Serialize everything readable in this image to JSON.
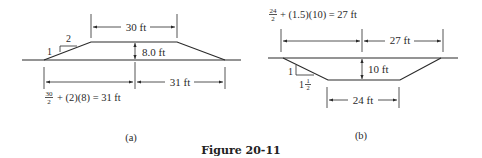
{
  "figure": {
    "caption": "Figure 20-11",
    "panels": [
      {
        "id": "a",
        "label": "(a)",
        "type": "embankment",
        "top_width_label": "30 ft",
        "height_label": "8.0 ft",
        "half_base_label": "31 ft",
        "slope": {
          "rise": "1",
          "run": "2"
        },
        "formula": {
          "num": "30",
          "den": "2",
          "rest": "+ (2)(8) = 31 ft"
        }
      },
      {
        "id": "b",
        "label": "(b)",
        "type": "excavation",
        "bottom_width_label": "24 ft",
        "depth_label": "10 ft",
        "half_top_label": "27 ft",
        "slope": {
          "rise": "1",
          "run_whole": "1",
          "run_frac_num": "1",
          "run_frac_den": "2"
        },
        "formula": {
          "num": "24",
          "den": "2",
          "rest": "+ (1.5)(10) = 27 ft"
        }
      }
    ]
  }
}
